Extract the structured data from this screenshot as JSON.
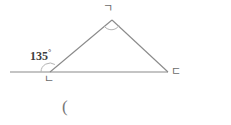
{
  "figure": {
    "type": "geometry-diagram",
    "stroke_color": "#8a8a8a",
    "label_color": "#6b6b6b",
    "angle_text_color": "#3d3d3d",
    "background_color": "#ffffff"
  },
  "labels": {
    "apex": "ㄱ",
    "bottom_left": "ㄴ",
    "bottom_right": "ㄷ",
    "exterior_angle_value": "135",
    "degree_symbol": "°",
    "stray_paren": "("
  },
  "geometry": {
    "vertices": {
      "apex": {
        "x": 112,
        "y": 20
      },
      "bottom_left": {
        "x": 50,
        "y": 72
      },
      "bottom_right": {
        "x": 168,
        "y": 72
      }
    },
    "ray": {
      "x1": 10,
      "y1": 72,
      "x2": 50,
      "y2": 72
    },
    "arc_apex": {
      "cx": 112,
      "cy": 20,
      "r": 9
    },
    "arc_exterior": {
      "cx": 50,
      "cy": 72,
      "r": 9
    }
  }
}
